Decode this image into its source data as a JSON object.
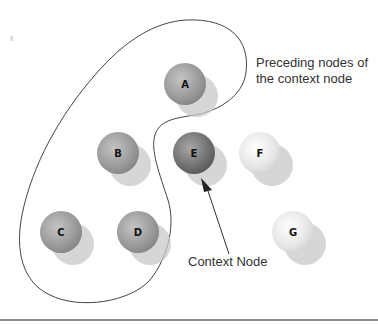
{
  "diagram": {
    "annotations": {
      "preceding_line1": "Preceding nodes of",
      "preceding_line2": "the context node",
      "context_node": "Context Node"
    },
    "nodes": [
      {
        "id": "A",
        "label": "A",
        "shade": "medium",
        "group": "preceding"
      },
      {
        "id": "B",
        "label": "B",
        "shade": "medium",
        "group": "preceding"
      },
      {
        "id": "C",
        "label": "C",
        "shade": "medium",
        "group": "preceding"
      },
      {
        "id": "D",
        "label": "D",
        "shade": "medium",
        "group": "preceding"
      },
      {
        "id": "E",
        "label": "E",
        "shade": "dark",
        "group": "context"
      },
      {
        "id": "F",
        "label": "F",
        "shade": "light",
        "group": "other"
      },
      {
        "id": "G",
        "label": "G",
        "shade": "light",
        "group": "other"
      }
    ],
    "colors": {
      "medium": "#9a9a9a",
      "dark": "#6e6e6e",
      "light": "#e8e8e8",
      "shadow": "#c8c8c8",
      "outline": "#444444",
      "rule": "#666666"
    }
  }
}
